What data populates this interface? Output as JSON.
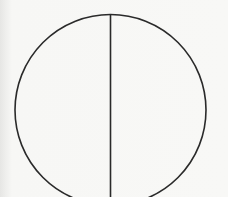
{
  "diagram": {
    "type": "circle-with-diameter",
    "circle": {
      "cx": 110.5,
      "cy": 110,
      "r": 95.5,
      "stroke": "#2a2a2a",
      "stroke_width": 1.6
    },
    "diameter_line": {
      "x": 110.5,
      "y1": 14,
      "y2": 197,
      "stroke": "#2a2a2a",
      "stroke_width": 1.6
    },
    "background": "#f7f7f5"
  }
}
